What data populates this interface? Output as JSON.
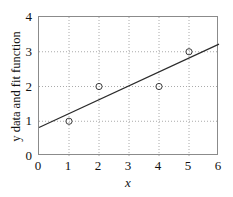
{
  "chart_data": {
    "type": "scatter",
    "title": "",
    "xlabel": "x",
    "ylabel": "y data and fit function",
    "xlim": [
      0,
      6
    ],
    "ylim": [
      0,
      4
    ],
    "xticks": [
      "0",
      "1",
      "2",
      "3",
      "4",
      "5",
      "6"
    ],
    "yticks": [
      "0",
      "1",
      "2",
      "3",
      "4"
    ],
    "xtick_values": [
      0,
      1,
      2,
      3,
      4,
      5,
      6
    ],
    "ytick_values": [
      0,
      1,
      2,
      3,
      4
    ],
    "grid": true,
    "grid_style": "dotted",
    "grid_color": "#aaaaaa",
    "legend": "none",
    "frame_color": "#8b8b8b",
    "background_color": "#ffffff",
    "series": [
      {
        "name": "y data",
        "type": "scatter",
        "marker": "open-circle",
        "marker_color": "#3a3a3a",
        "x": [
          1,
          2,
          4,
          5
        ],
        "y": [
          1,
          2,
          2,
          3
        ],
        "points": [
          {
            "x": 1,
            "y": 1
          },
          {
            "x": 2,
            "y": 2
          },
          {
            "x": 4,
            "y": 2
          },
          {
            "x": 5,
            "y": 3
          }
        ]
      },
      {
        "name": "fit function",
        "type": "line",
        "line_color": "#2b2b2b",
        "slope": 0.4,
        "intercept": 0.82,
        "x": [
          0,
          6
        ],
        "y": [
          0.82,
          3.22
        ]
      }
    ]
  },
  "axes": {
    "x_title": "x",
    "y_title": "y data and fit function"
  }
}
